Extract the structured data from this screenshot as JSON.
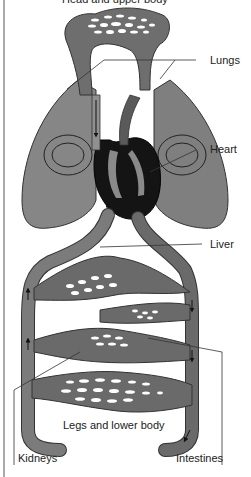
{
  "labels": {
    "top": "Head and upper body",
    "lungs": "Lungs",
    "heart": "Heart",
    "liver": "Liver",
    "legs": "Legs and lower body",
    "kidneys": "Kidneys",
    "intestines": "Intestines"
  },
  "colors": {
    "vessel": "#7a7a7a",
    "vessel_dark": "#5e5e5e",
    "lung": "#8a8a8a",
    "heart": "#111111",
    "capillary_hole": "#ffffff",
    "outline": "#2a2a2a",
    "leader_line": "#333333"
  },
  "icons": {
    "flow_arrow": "arrowhead-icon"
  }
}
